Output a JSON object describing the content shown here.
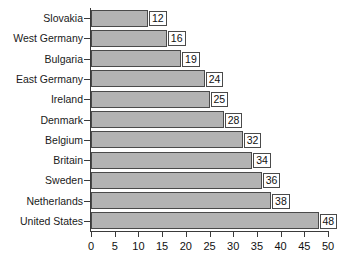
{
  "chart_data": {
    "type": "bar",
    "orientation": "horizontal",
    "title": "",
    "xlabel": "",
    "ylabel": "",
    "xlim": [
      0,
      50
    ],
    "xticks": [
      0,
      5,
      10,
      15,
      20,
      25,
      30,
      35,
      40,
      45,
      50
    ],
    "grid": false,
    "legend": null,
    "show_value_labels": true,
    "categories": [
      "Slovakia",
      "West Germany",
      "Bulgaria",
      "East Germany",
      "Ireland",
      "Denmark",
      "Belgium",
      "Britain",
      "Sweden",
      "Netherlands",
      "United States"
    ],
    "values": [
      12,
      16,
      19,
      24,
      25,
      28,
      32,
      34,
      36,
      38,
      48
    ],
    "value_labels": [
      "12",
      "16",
      "19",
      "24",
      "25",
      "28",
      "32",
      "34",
      "36",
      "38",
      "48"
    ],
    "colors": {
      "bar_fill": "#b3b3b3",
      "bar_border": "#4a4a4a",
      "axis": "#3a3a3a",
      "text": "#111111",
      "background": "#ffffff",
      "value_box_fill": "#ffffff"
    }
  },
  "title_remnant": "",
  "axis": {
    "x_tick_labels": [
      "0",
      "5",
      "10",
      "15",
      "20",
      "25",
      "30",
      "35",
      "40",
      "45",
      "50"
    ]
  }
}
